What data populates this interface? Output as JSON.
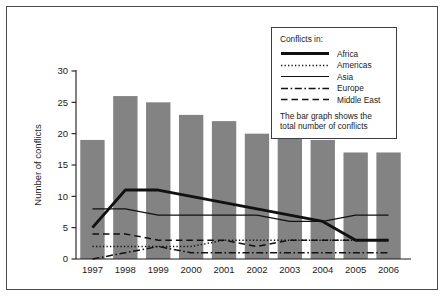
{
  "chart_data": {
    "type": "bar",
    "title": "",
    "xlabel": "",
    "ylabel": "Number of conflicts",
    "categories": [
      "1997",
      "1998",
      "1999",
      "2000",
      "2001",
      "2002",
      "2003",
      "2004",
      "2005",
      "2006"
    ],
    "values": [
      19,
      26,
      25,
      23,
      22,
      20,
      20,
      19,
      17,
      17
    ],
    "bar_series_name": "Total number of conflicts",
    "ylim": [
      0,
      30
    ],
    "yticks": [
      0,
      5,
      10,
      15,
      20,
      25,
      30
    ],
    "ytick_labels": [
      "0",
      "5",
      "10",
      "15",
      "20",
      "25",
      "30"
    ],
    "grid": false,
    "legend_position": "top-right",
    "series": [
      {
        "name": "Africa",
        "style": "solid-thick",
        "values": [
          5,
          11,
          11,
          10,
          9,
          8,
          7,
          6,
          3,
          3
        ]
      },
      {
        "name": "Americas",
        "style": "dotted",
        "values": [
          2,
          2,
          2,
          2,
          3,
          3,
          3,
          3,
          3,
          3
        ]
      },
      {
        "name": "Asia",
        "style": "solid-thin",
        "values": [
          8,
          8,
          7,
          7,
          7,
          7,
          6,
          6,
          7,
          7
        ]
      },
      {
        "name": "Europe",
        "style": "dash-dot",
        "values": [
          0,
          1,
          2,
          1,
          1,
          1,
          1,
          1,
          1,
          1
        ]
      },
      {
        "name": "Middle East",
        "style": "dashed",
        "values": [
          4,
          4,
          3,
          3,
          3,
          2,
          3,
          3,
          3,
          3
        ]
      }
    ]
  },
  "legend": {
    "title": "Conflicts in:",
    "entries": [
      {
        "label": "Africa"
      },
      {
        "label": "Americas"
      },
      {
        "label": "Asia"
      },
      {
        "label": "Europe"
      },
      {
        "label": "Middle East"
      }
    ],
    "note_line1": "The bar graph shows the",
    "note_line2": "total number of conflicts"
  },
  "axes": {
    "y_title": "Number of conflicts",
    "y_ticks": [
      "0",
      "5",
      "10",
      "15",
      "20",
      "25",
      "30"
    ],
    "x_ticks": [
      "1997",
      "1998",
      "1999",
      "2000",
      "2001",
      "2002",
      "2003",
      "2004",
      "2005",
      "2006"
    ]
  },
  "colors": {
    "bar_fill": "#838383",
    "line": "#111111",
    "border": "#4a4a52",
    "background": "#ffffff"
  }
}
